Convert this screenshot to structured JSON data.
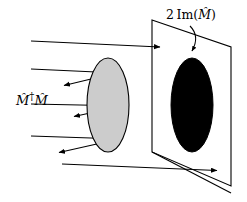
{
  "figure": {
    "background_color": "#ffffff",
    "stroke_color": "#000000",
    "width": 247,
    "height": 202
  },
  "labels": {
    "left_operator": {
      "text": "M̂†M̂",
      "parts": {
        "symbol": "M̂",
        "dagger": "†",
        "symbol2": "M̂"
      }
    },
    "right_operator": {
      "text": "2 Im(M̂)",
      "parts": {
        "coefficient": "2",
        "function": "Im",
        "open_paren": "(",
        "symbol": "M̂",
        "close_paren": ")"
      }
    }
  },
  "shapes": {
    "gray_ellipse": {
      "name": "gray-ellipse",
      "fill": "#cccccc",
      "stroke": "#000000",
      "cx": 108,
      "cy": 105,
      "rx": 21,
      "ry": 47
    },
    "black_ellipse": {
      "name": "black-ellipse",
      "fill": "#000000",
      "stroke": "#000000",
      "cx": 192,
      "cy": 105,
      "rx": 21,
      "ry": 47
    },
    "plane": {
      "name": "projection-plane",
      "fill": "#ffffff",
      "stroke": "#000000",
      "points": "152,20 231,47 231,186 152,152"
    }
  },
  "rays": {
    "incoming": [
      {
        "name": "ray-top",
        "x1": 31,
        "y1": 41,
        "x2": 163,
        "y2": 47,
        "arrow": true
      },
      {
        "name": "ray-upper-mid",
        "x1": 31,
        "y1": 69,
        "x2": 118,
        "y2": 73,
        "arrow": false
      },
      {
        "name": "ray-middle",
        "x1": 31,
        "y1": 104,
        "x2": 128,
        "y2": 106,
        "arrow": false
      },
      {
        "name": "ray-lower",
        "x1": 31,
        "y1": 136,
        "x2": 120,
        "y2": 139,
        "arrow": false
      },
      {
        "name": "ray-bottom",
        "x1": 62,
        "y1": 164,
        "x2": 220,
        "y2": 171,
        "arrow": true
      }
    ],
    "reflected": [
      {
        "name": "reflected-ray-upper",
        "x1": 116,
        "y1": 73,
        "x2": 62,
        "y2": 86,
        "arrow": true
      },
      {
        "name": "reflected-ray-lower",
        "x1": 127,
        "y1": 105,
        "x2": 72,
        "y2": 117,
        "arrow": true
      },
      {
        "name": "reflected-ray-bottom",
        "x1": 119,
        "y1": 139,
        "x2": 57,
        "y2": 153,
        "arrow": true
      }
    ],
    "through": [
      {
        "name": "ray-through-plane",
        "x1": 152,
        "y1": 152,
        "x2": 231,
        "y2": 193
      }
    ],
    "callout": {
      "name": "callout-arrow",
      "description": "curved arrow from 2 Im(M-hat) label to black ellipse top"
    }
  }
}
